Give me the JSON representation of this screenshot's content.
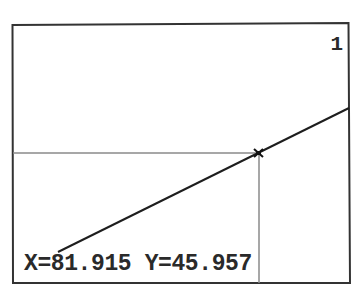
{
  "calculator_screen": {
    "graph_number": "1",
    "trace": {
      "x_label": "X=81.915",
      "y_label": "Y=45.957",
      "x_value": 81.915,
      "y_value": 45.957
    },
    "colors": {
      "frame": "#333333",
      "plot_line": "#1e1e1e",
      "trace_guides": "#8a8a8a",
      "background": "#ffffff"
    }
  }
}
